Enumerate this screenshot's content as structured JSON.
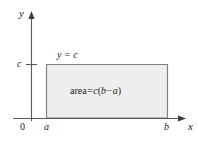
{
  "figure": {
    "axes": {
      "y_axis_label": "y",
      "x_axis_label": "x",
      "origin_label": "0"
    },
    "ticks": {
      "y_tick_label": "c",
      "x_tick_left_label": "a",
      "x_tick_right_label": "b"
    },
    "annotations": {
      "function_label": "y = c",
      "area_label_prefix": "area",
      "area_label_equals": "=",
      "area_label_c": "c",
      "area_label_open_paren": "(",
      "area_label_b": "b",
      "area_label_minus": "−",
      "area_label_a": "a",
      "area_label_close_paren": ")",
      "area_label_full": "area = c(b − a)"
    },
    "colors": {
      "background": "#ffffff",
      "rect_fill": "#eeeeee",
      "rect_stroke": "#808080",
      "axis_stroke": "#595959",
      "text": "#1a1a1a"
    },
    "geometry": {
      "canvas_width": 199,
      "canvas_height": 145,
      "y_axis_x": 31,
      "x_axis_y": 118,
      "rect_left": 46,
      "rect_right": 168,
      "rect_top": 64,
      "rect_bottom": 118
    }
  }
}
